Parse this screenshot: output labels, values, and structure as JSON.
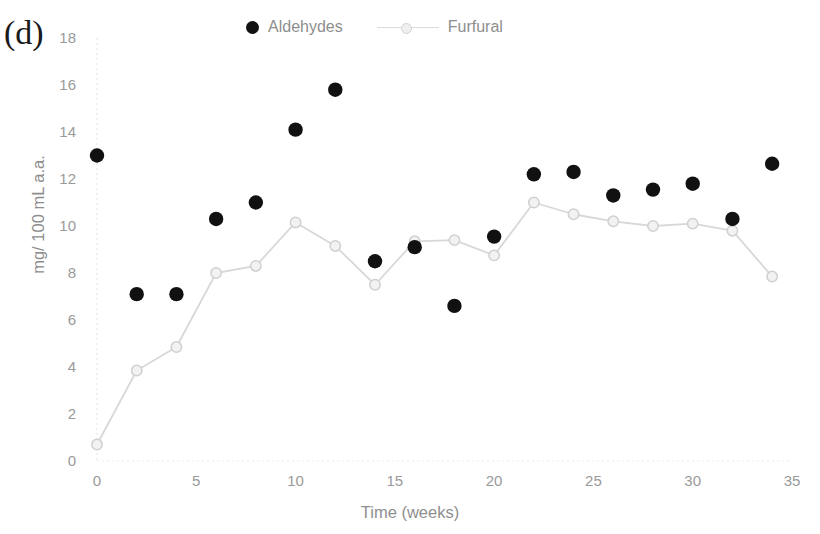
{
  "panel": {
    "label": "(d)"
  },
  "legend": {
    "items": [
      {
        "label": "Aldehydes",
        "marker": "filled-circle-icon",
        "color": "#111111"
      },
      {
        "label": "Furfural",
        "marker": "line-circle-icon",
        "color": "#d8d8d8"
      }
    ]
  },
  "chart_data": {
    "type": "scatter",
    "title": "(d)",
    "xlabel": "Time (weeks)",
    "ylabel": "mg/ 100 mL a.a.",
    "xlim": [
      0,
      35
    ],
    "ylim": [
      0,
      18
    ],
    "xticks": [
      0,
      5,
      10,
      15,
      20,
      25,
      30,
      35
    ],
    "yticks": [
      0,
      2,
      4,
      6,
      8,
      10,
      12,
      14,
      16,
      18
    ],
    "grid": false,
    "legend_position": "top",
    "x": [
      0,
      2,
      4,
      6,
      8,
      10,
      12,
      14,
      16,
      18,
      20,
      22,
      24,
      26,
      28,
      30,
      32,
      34
    ],
    "series": [
      {
        "name": "Aldehydes",
        "type": "scatter",
        "color": "#111111",
        "values": [
          13.0,
          7.1,
          7.1,
          10.3,
          11.0,
          14.1,
          15.8,
          8.5,
          9.1,
          6.6,
          9.55,
          12.2,
          12.3,
          11.3,
          11.55,
          11.8,
          10.3,
          12.65
        ]
      },
      {
        "name": "Furfural",
        "type": "line",
        "color": "#d8d8d8",
        "values": [
          0.7,
          3.85,
          4.85,
          8.0,
          8.3,
          10.15,
          9.15,
          7.5,
          9.35,
          9.4,
          8.75,
          11.0,
          10.5,
          10.2,
          10.0,
          10.1,
          9.8,
          7.85
        ]
      }
    ]
  },
  "plot_geometry": {
    "x0_px": 97,
    "x_per_unit_px": 19.857,
    "y0_px": 461,
    "y_per_unit_px": 23.5,
    "tick_label_color": "#9a9a9a",
    "axis_line_color": "#e8e8e8"
  }
}
